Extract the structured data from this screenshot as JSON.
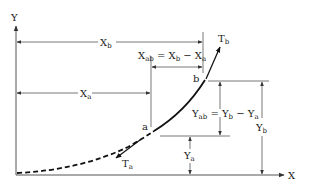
{
  "diagram": {
    "type": "catenary-span-geometry",
    "axes": {
      "x_label": "X",
      "y_label": "Y"
    },
    "points": [
      {
        "id": "a",
        "label": "a"
      },
      {
        "id": "b",
        "label": "b"
      }
    ],
    "tensions": [
      {
        "id": "Ta",
        "main": "T",
        "sub": "a"
      },
      {
        "id": "Tb",
        "main": "T",
        "sub": "b"
      }
    ],
    "dimensions": {
      "xb": {
        "main": "X",
        "sub": "b"
      },
      "xa": {
        "main": "X",
        "sub": "a"
      },
      "xab": {
        "main": "X",
        "sub": "ab",
        "eq": " = X",
        "eq_sub": "b",
        "minus": " − X",
        "minus_sub": "a"
      },
      "ya": {
        "main": "Y",
        "sub": "a"
      },
      "yb": {
        "main": "Y",
        "sub": "b"
      },
      "yab": {
        "main": "Y",
        "sub": "ab",
        "eq": " = Y",
        "eq_sub": "b",
        "minus": " − Y",
        "minus_sub": "a"
      }
    },
    "colors": {
      "line": "#222222",
      "dim_line": "#555555",
      "background": "#ffffff"
    }
  }
}
